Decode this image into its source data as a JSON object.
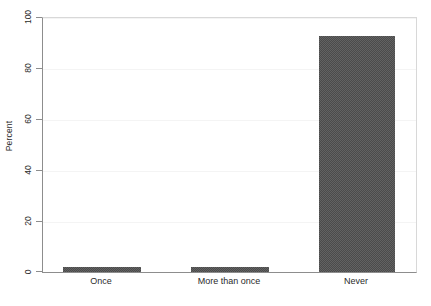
{
  "chart_data": {
    "type": "bar",
    "title": "",
    "subtitle": "",
    "xlabel": "",
    "ylabel": "Percent",
    "categories": [
      "Once",
      "More than once",
      "Never"
    ],
    "values": [
      2,
      2,
      93
    ],
    "ylim": [
      0,
      100
    ],
    "xlim": [
      0,
      3
    ],
    "yticks": [
      0,
      20,
      40,
      60,
      80,
      100
    ],
    "ytick_labels": [
      "0",
      "20",
      "40",
      "60",
      "80",
      "100"
    ],
    "grid": "horizontal-faint",
    "legend": "none",
    "bar_color": "#4b4b4b",
    "background_color": "#ffffff",
    "axis_color": "#8d8d8d",
    "gridline_color": "#f4f4f4",
    "bars": [
      {
        "label": "Once",
        "value": 2,
        "left_px": 20,
        "width_px": 78
      },
      {
        "label": "More than once",
        "value": 2,
        "left_px": 148,
        "width_px": 78
      },
      {
        "label": "Never",
        "value": 93,
        "left_px": 276,
        "width_px": 76
      }
    ]
  }
}
